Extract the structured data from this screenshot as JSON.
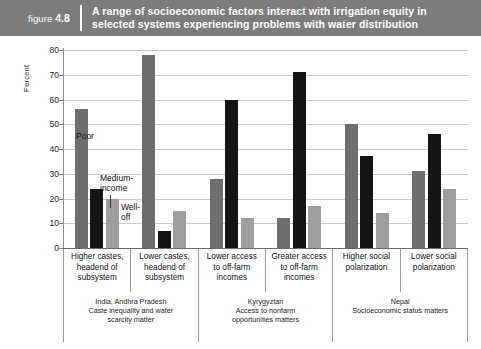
{
  "banner": {
    "figure_prefix": "figure",
    "figure_number": "4.8",
    "title_line1": "A range of socioeconomic factors interact with irrigation equity in",
    "title_line2": "selected systems experiencing problems with water distribution",
    "background_color": "#7c7c7c",
    "text_color": "#ffffff"
  },
  "annotations": {
    "poor": "Poor",
    "medium_line1": "Medium-",
    "medium_line2": "income",
    "well_line1": "Well-",
    "well_line2": "off"
  },
  "colors": {
    "poor": "#6e6e6e",
    "medium": "#151515",
    "well": "#9d9d9d",
    "gridline": "#c9c9c9",
    "axis": "#6a6a6a"
  },
  "sources": [
    {
      "span": 2,
      "country": "India, Andhra Pradesh",
      "sub_line1": "Caste inequality and water",
      "sub_line2": "scarcity matter"
    },
    {
      "span": 2,
      "country": "Kyrygyztan",
      "sub_line1": "Access to nonfarm",
      "sub_line2": "opportunities matters"
    },
    {
      "span": 2,
      "country": "Nepal",
      "sub_line1": "Socioeconomic status matters",
      "sub_line2": ""
    }
  ],
  "chart_data": {
    "type": "bar",
    "title": "A range of socioeconomic factors interact with irrigation equity in selected systems experiencing problems with water distribution",
    "xlabel": "",
    "ylabel": "Percent",
    "ylim": [
      0,
      80
    ],
    "yticks": [
      0,
      10,
      20,
      30,
      40,
      50,
      60,
      70,
      80
    ],
    "grid": true,
    "legend_position": "inline-annotation",
    "categories": [
      [
        "Higher castes,",
        "headend of",
        "subsystem"
      ],
      [
        "Lower castes,",
        "headend of",
        "subsystem"
      ],
      [
        "Lower access",
        "to off-farm",
        "incomes"
      ],
      [
        "Greater access",
        "to off-farm",
        "incomes"
      ],
      [
        "Higher social",
        "polarization",
        ""
      ],
      [
        "Lower social",
        "polarization",
        ""
      ]
    ],
    "series": [
      {
        "name": "Poor",
        "color": "#6e6e6e",
        "values": [
          56,
          78,
          28,
          12,
          50,
          31
        ]
      },
      {
        "name": "Medium-income",
        "color": "#151515",
        "values": [
          24,
          7,
          60,
          71,
          37,
          46
        ]
      },
      {
        "name": "Well-off",
        "color": "#9d9d9d",
        "values": [
          20,
          15,
          12,
          17,
          14,
          24
        ]
      }
    ]
  }
}
